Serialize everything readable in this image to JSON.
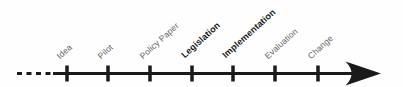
{
  "timeline": {
    "stages": [
      {
        "label": "Idea",
        "emphasis": false
      },
      {
        "label": "Pilot",
        "emphasis": false
      },
      {
        "label": "Policy Paper",
        "emphasis": false
      },
      {
        "label": "Legislation",
        "emphasis": true
      },
      {
        "label": "Implementation",
        "emphasis": true
      },
      {
        "label": "Evaluation",
        "emphasis": false
      },
      {
        "label": "Change",
        "emphasis": false
      }
    ],
    "direction": "left-to-right",
    "line_start_style": "dashed",
    "line_end_style": "arrowhead",
    "colors": {
      "line": "#1a1a1a",
      "label_regular": "#636363",
      "label_emphasis": "#1a1a1a",
      "background": "#fefefe"
    }
  }
}
